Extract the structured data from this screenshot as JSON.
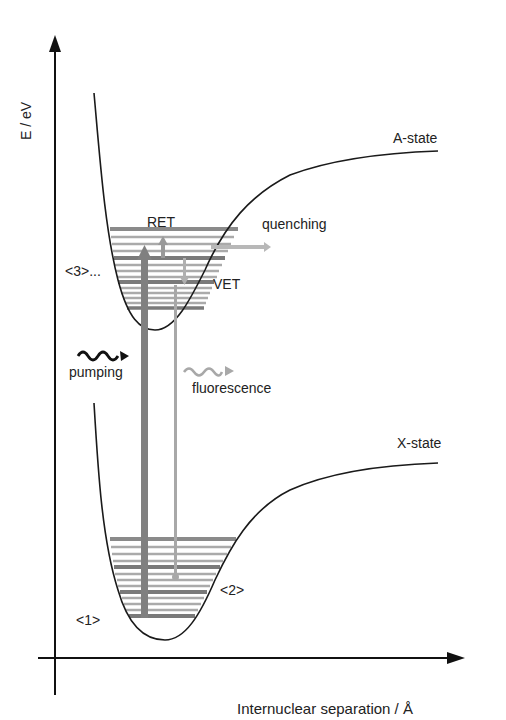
{
  "diagram": {
    "type": "potential-energy-curves",
    "axes": {
      "y_label": "E / eV",
      "x_label": "Internuclear separation / Å"
    },
    "states": [
      {
        "name": "A-state",
        "label": "A-state"
      },
      {
        "name": "X-state",
        "label": "X-state"
      }
    ],
    "processes": {
      "ret": "RET",
      "vet": "VET",
      "quenching": "quenching",
      "pumping": "pumping",
      "fluorescence": "fluorescence"
    },
    "level_markers": {
      "m1": "<1>",
      "m2": "<2>",
      "m3": "<3>..."
    },
    "colors": {
      "curve": "#1a1a1a",
      "levels": "#9a9a9a",
      "levels_dark": "#7a7a7a",
      "pump_arrow": "#808080",
      "fluor_arrow": "#b0b0b0",
      "text": "#222222"
    }
  }
}
